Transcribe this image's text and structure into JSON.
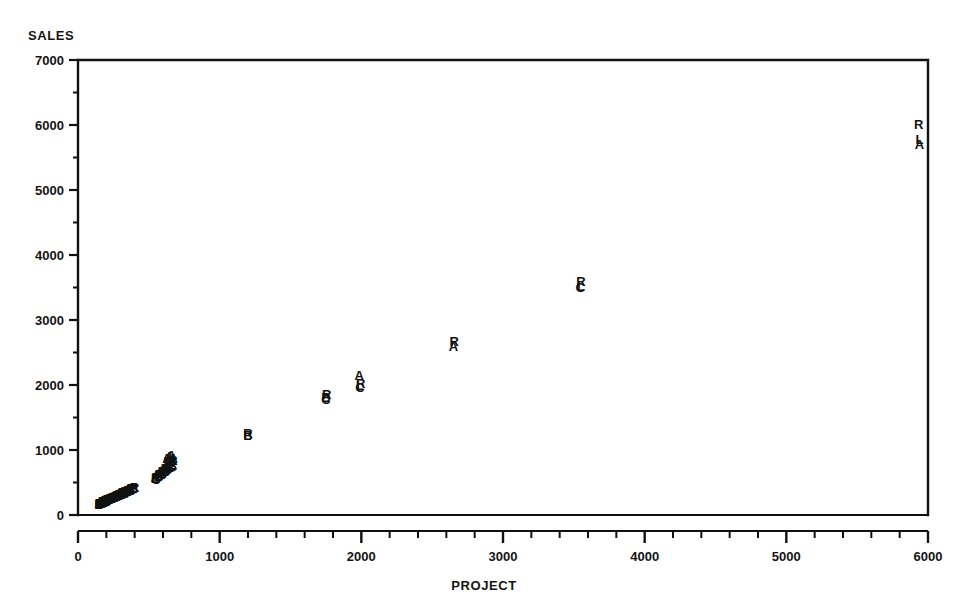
{
  "chart_data": {
    "type": "scatter",
    "title": "",
    "subtitle": "",
    "xlabel": "PROJECT",
    "ylabel": "SALES",
    "xlim": [
      0,
      6000
    ],
    "ylim": [
      0,
      7000
    ],
    "xticks": [
      0,
      1000,
      2000,
      3000,
      4000,
      5000,
      6000
    ],
    "yticks": [
      0,
      1000,
      2000,
      3000,
      4000,
      5000,
      6000,
      7000
    ],
    "xtick_labels": [
      "0",
      "1000",
      "2000",
      "3000",
      "4000",
      "5000",
      "6000"
    ],
    "ytick_labels": [
      "0",
      "1000",
      "2000",
      "3000",
      "4000",
      "5000",
      "6000",
      "7000"
    ],
    "x_minor_tick_step": 200,
    "y_minor_tick_step": 500,
    "grid": false,
    "legend": "none",
    "marker_style": "letter-glyph",
    "series": [
      {
        "name": "A",
        "label": "A",
        "points": [
          [
            150,
            160
          ],
          [
            172,
            178
          ],
          [
            190,
            200
          ],
          [
            205,
            215
          ],
          [
            222,
            232
          ],
          [
            240,
            250
          ],
          [
            258,
            268
          ],
          [
            275,
            282
          ],
          [
            292,
            300
          ],
          [
            310,
            318
          ],
          [
            330,
            340
          ],
          [
            352,
            362
          ],
          [
            372,
            382
          ],
          [
            395,
            405
          ],
          [
            545,
            560
          ],
          [
            568,
            600
          ],
          [
            590,
            640
          ],
          [
            612,
            690
          ],
          [
            628,
            860
          ],
          [
            645,
            880
          ],
          [
            660,
            900
          ],
          [
            672,
            860
          ],
          [
            1985,
            2130
          ],
          [
            2650,
            2570
          ],
          [
            5940,
            5680
          ]
        ]
      },
      {
        "name": "B",
        "label": "B",
        "points": [
          [
            148,
            150
          ],
          [
            168,
            168
          ],
          [
            186,
            190
          ],
          [
            202,
            205
          ],
          [
            220,
            222
          ],
          [
            238,
            240
          ],
          [
            256,
            258
          ],
          [
            272,
            272
          ],
          [
            290,
            292
          ],
          [
            308,
            310
          ],
          [
            328,
            330
          ],
          [
            350,
            352
          ],
          [
            370,
            372
          ],
          [
            392,
            394
          ],
          [
            548,
            540
          ],
          [
            570,
            580
          ],
          [
            592,
            620
          ],
          [
            615,
            660
          ],
          [
            632,
            700
          ],
          [
            650,
            720
          ],
          [
            665,
            740
          ],
          [
            1200,
            1210
          ],
          [
            1750,
            1790
          ]
        ]
      },
      {
        "name": "C",
        "label": "C",
        "points": [
          [
            152,
            145
          ],
          [
            170,
            162
          ],
          [
            188,
            182
          ],
          [
            204,
            198
          ],
          [
            224,
            215
          ],
          [
            242,
            232
          ],
          [
            260,
            250
          ],
          [
            276,
            264
          ],
          [
            294,
            284
          ],
          [
            312,
            302
          ],
          [
            332,
            322
          ],
          [
            354,
            344
          ],
          [
            374,
            364
          ],
          [
            396,
            386
          ],
          [
            550,
            530
          ],
          [
            572,
            570
          ],
          [
            594,
            610
          ],
          [
            616,
            650
          ],
          [
            634,
            690
          ],
          [
            652,
            710
          ],
          [
            668,
            730
          ],
          [
            1750,
            1760
          ],
          [
            1990,
            1950
          ],
          [
            3545,
            3480
          ]
        ]
      },
      {
        "name": "L",
        "label": "L",
        "points": [
          [
            146,
            155
          ],
          [
            166,
            172
          ],
          [
            184,
            192
          ],
          [
            200,
            208
          ],
          [
            218,
            225
          ],
          [
            236,
            244
          ],
          [
            254,
            260
          ],
          [
            270,
            276
          ],
          [
            288,
            295
          ],
          [
            306,
            312
          ],
          [
            326,
            332
          ],
          [
            348,
            354
          ],
          [
            368,
            374
          ],
          [
            390,
            396
          ],
          [
            546,
            548
          ],
          [
            566,
            588
          ],
          [
            588,
            628
          ],
          [
            610,
            668
          ],
          [
            626,
            702
          ],
          [
            644,
            724
          ],
          [
            662,
            748
          ],
          [
            1990,
            1980
          ],
          [
            3550,
            3500
          ],
          [
            5940,
            5760
          ]
        ]
      },
      {
        "name": "R",
        "label": "R",
        "points": [
          [
            154,
            168
          ],
          [
            174,
            186
          ],
          [
            192,
            206
          ],
          [
            206,
            220
          ],
          [
            226,
            238
          ],
          [
            244,
            256
          ],
          [
            262,
            274
          ],
          [
            278,
            288
          ],
          [
            296,
            306
          ],
          [
            314,
            324
          ],
          [
            334,
            346
          ],
          [
            356,
            368
          ],
          [
            376,
            388
          ],
          [
            398,
            410
          ],
          [
            552,
            568
          ],
          [
            574,
            608
          ],
          [
            596,
            648
          ],
          [
            618,
            700
          ],
          [
            636,
            800
          ],
          [
            654,
            812
          ],
          [
            670,
            820
          ],
          [
            1200,
            1230
          ],
          [
            1755,
            1830
          ],
          [
            1995,
            2000
          ],
          [
            2655,
            2660
          ],
          [
            3550,
            3580
          ],
          [
            5935,
            5990
          ]
        ]
      }
    ]
  }
}
